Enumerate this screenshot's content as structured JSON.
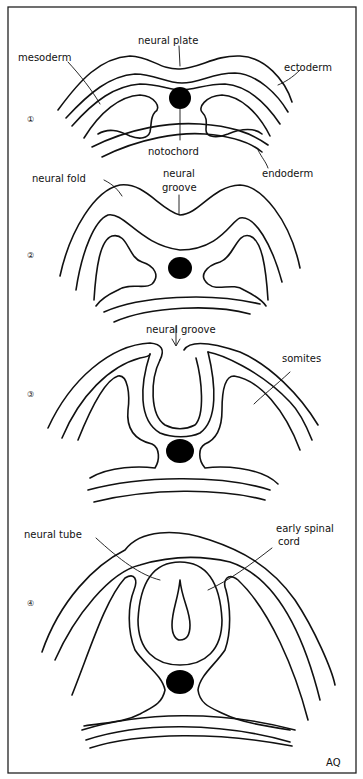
{
  "figure": {
    "signature": "AQ",
    "colors": {
      "ink": "#111111",
      "paper": "#ffffff",
      "notochord": "#000000"
    }
  },
  "stages": [
    {
      "number": "1",
      "labels": {
        "neural_plate": "neural plate",
        "mesoderm": "mesoderm",
        "ectoderm": "ectoderm",
        "notochord": "notochord",
        "endoderm": "endoderm"
      }
    },
    {
      "number": "2",
      "labels": {
        "neural_fold": "neural fold",
        "neural_groove_1": "neural",
        "neural_groove_2": "groove"
      }
    },
    {
      "number": "3",
      "labels": {
        "neural_groove": "neural groove",
        "somites": "somites"
      }
    },
    {
      "number": "4",
      "labels": {
        "neural_tube": "neural tube",
        "early_spinal_cord_1": "early spinal",
        "early_spinal_cord_2": "cord"
      }
    }
  ]
}
